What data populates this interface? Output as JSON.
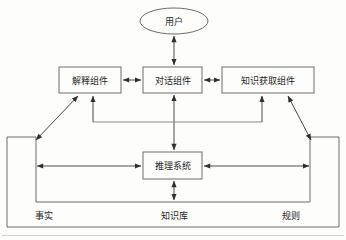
{
  "diagram": {
    "type": "block-architecture",
    "background_color": "#fdfdfc",
    "line_color": "#6d6d6d",
    "arrow_color": "#4a4a4a",
    "text_color": "#1d1d1d",
    "nodes": [
      {
        "id": "user",
        "label": "用户",
        "shape": "ellipse",
        "cx": 174,
        "cy": 21,
        "rx": 34,
        "ry": 13
      },
      {
        "id": "explanation",
        "label": "解释组件",
        "shape": "rect",
        "x": 59,
        "y": 67,
        "w": 62,
        "h": 26
      },
      {
        "id": "dialogue",
        "label": "对话组件",
        "shape": "rect",
        "x": 143,
        "y": 67,
        "w": 59,
        "h": 26
      },
      {
        "id": "knowledge-acquisition",
        "label": "知识获取组件",
        "shape": "rect",
        "x": 222,
        "y": 67,
        "w": 92,
        "h": 26
      },
      {
        "id": "inference",
        "label": "推理系统",
        "shape": "rect",
        "x": 143,
        "y": 152,
        "w": 59,
        "h": 27
      }
    ],
    "regions": [
      {
        "id": "facts",
        "label": "事实",
        "label_x": 44,
        "label_y": 216
      },
      {
        "id": "knowledge-base",
        "label": "知识库",
        "label_x": 174,
        "label_y": 216
      },
      {
        "id": "rules",
        "label": "规则",
        "label_x": 291,
        "label_y": 216
      }
    ],
    "edges": [
      {
        "from": "user",
        "to": "dialogue",
        "style": "double-arrow",
        "orientation": "vertical"
      },
      {
        "from": "explanation",
        "to": "dialogue",
        "style": "double-arrow",
        "orientation": "horizontal"
      },
      {
        "from": "dialogue",
        "to": "knowledge-acquisition",
        "style": "double-arrow",
        "orientation": "horizontal"
      },
      {
        "from": "inference",
        "to": "dialogue",
        "style": "double-arrow",
        "orientation": "vertical"
      },
      {
        "from": "inference-bus",
        "to": "explanation",
        "style": "arrow",
        "orientation": "vertical"
      },
      {
        "from": "inference-bus",
        "to": "knowledge-acquisition",
        "style": "arrow",
        "orientation": "vertical"
      },
      {
        "from": "facts",
        "to": "explanation",
        "style": "double-arrow",
        "orientation": "diagonal"
      },
      {
        "from": "knowledge-acquisition",
        "to": "rules",
        "style": "double-arrow",
        "orientation": "diagonal"
      },
      {
        "from": "facts",
        "to": "inference",
        "style": "double-arrow",
        "orientation": "horizontal"
      },
      {
        "from": "inference",
        "to": "rules",
        "style": "double-arrow",
        "orientation": "horizontal"
      },
      {
        "from": "inference",
        "to": "knowledge-base",
        "style": "double-arrow",
        "orientation": "vertical"
      }
    ]
  }
}
